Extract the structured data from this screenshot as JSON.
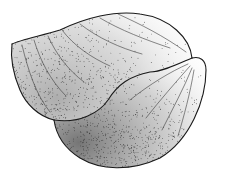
{
  "image": {
    "subject": "Stippled pen illustration of a bivalve shell (clam) viewed from the side",
    "colors": {
      "background": "#ffffff",
      "ink": "#1a1a1a",
      "stipple": "#2b2b2b"
    }
  }
}
